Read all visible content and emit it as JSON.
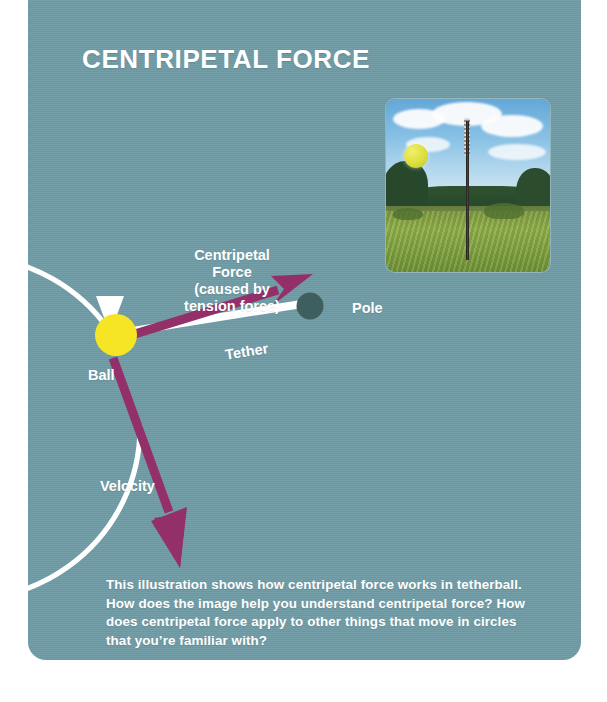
{
  "card": {
    "background_color": "#6f9ba5",
    "title": "CENTRIPETAL FORCE"
  },
  "diagram": {
    "labels": {
      "centripetal_force": "Centripetal\nForce\n(caused by\ntension force)",
      "centripetal_force_line1": "Centripetal",
      "centripetal_force_line2": "Force",
      "centripetal_force_line3": "(caused by",
      "centripetal_force_line4": "tension force)",
      "pole": "Pole",
      "ball": "Ball",
      "tether": "Tether",
      "velocity": "Velocity"
    },
    "colors": {
      "ball": "#f5e524",
      "pole_dot": "#3e5f5d",
      "force_arrow": "#93306a",
      "velocity_arrow": "#93306a",
      "motion_circle": "#ffffff",
      "tether_line": "#ffffff",
      "text": "#ffffff"
    },
    "elements": [
      {
        "name": "motion-circle-arrow",
        "description": "white circular arrow showing direction of ball motion"
      },
      {
        "name": "centripetal-force-arrow",
        "description": "magenta arrow from ball pointing toward pole"
      },
      {
        "name": "velocity-arrow",
        "description": "magenta arrow from ball pointing down and to the right, tangent to circle"
      },
      {
        "name": "tether-line",
        "description": "white line connecting ball to pole"
      }
    ]
  },
  "photo": {
    "alt": "tetherball pole standing in a grassy field with a yellow ball in the air, blue sky with clouds and a tree line behind"
  },
  "caption": {
    "text": "This illustration shows how centripetal force works in tetherball. How does the image help you understand centripetal force? How does centripetal force apply to other things that move in circles that you’re familiar with?"
  }
}
